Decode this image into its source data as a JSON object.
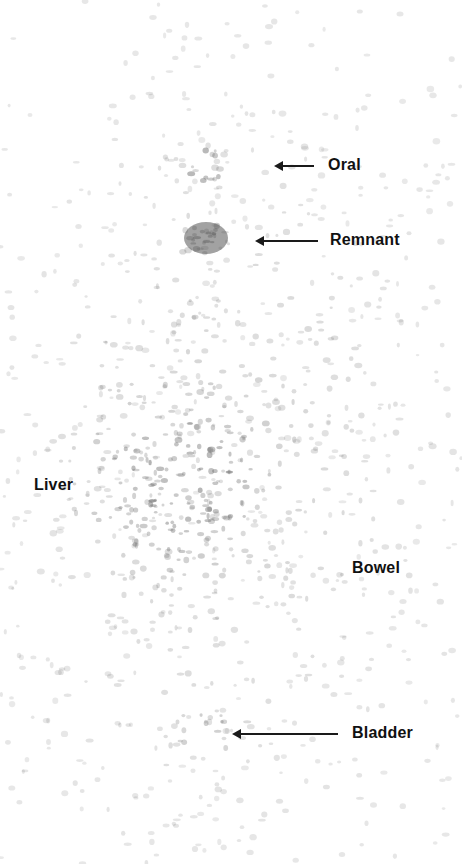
{
  "figure": {
    "type": "whole-body scintigraphy scan (anterior view)",
    "background": "#ffffff",
    "speckle_color": "#6a6a6a"
  },
  "labels": [
    {
      "id": "oral",
      "text": "Oral",
      "x": 328,
      "y": 156,
      "arrow": {
        "x1": 274,
        "x2": 314,
        "y": 166
      }
    },
    {
      "id": "remnant",
      "text": "Remnant",
      "x": 330,
      "y": 231,
      "arrow": {
        "x1": 255,
        "x2": 318,
        "y": 241
      }
    },
    {
      "id": "liver",
      "text": "Liver",
      "x": 34,
      "y": 476,
      "arrow": null
    },
    {
      "id": "bowel",
      "text": "Bowel",
      "x": 352,
      "y": 559,
      "arrow": null
    },
    {
      "id": "bladder",
      "text": "Bladder",
      "x": 352,
      "y": 724,
      "arrow": {
        "x1": 232,
        "x2": 338,
        "y": 734
      }
    }
  ],
  "uptake_regions": [
    {
      "name": "oral",
      "cx": 206,
      "cy": 165,
      "rx": 26,
      "ry": 18,
      "intensity": 0.55,
      "shape": "ring"
    },
    {
      "name": "remnant",
      "cx": 206,
      "cy": 238,
      "rx": 26,
      "ry": 20,
      "intensity": 0.85,
      "shape": "blob"
    },
    {
      "name": "liver",
      "cx": 170,
      "cy": 480,
      "rx": 90,
      "ry": 80,
      "intensity": 0.5,
      "shape": "diffuse"
    },
    {
      "name": "torso",
      "cx": 230,
      "cy": 460,
      "rx": 190,
      "ry": 330,
      "intensity": 0.22,
      "shape": "diffuse"
    },
    {
      "name": "bladder",
      "cx": 205,
      "cy": 730,
      "rx": 40,
      "ry": 30,
      "intensity": 0.3,
      "shape": "diffuse"
    }
  ]
}
